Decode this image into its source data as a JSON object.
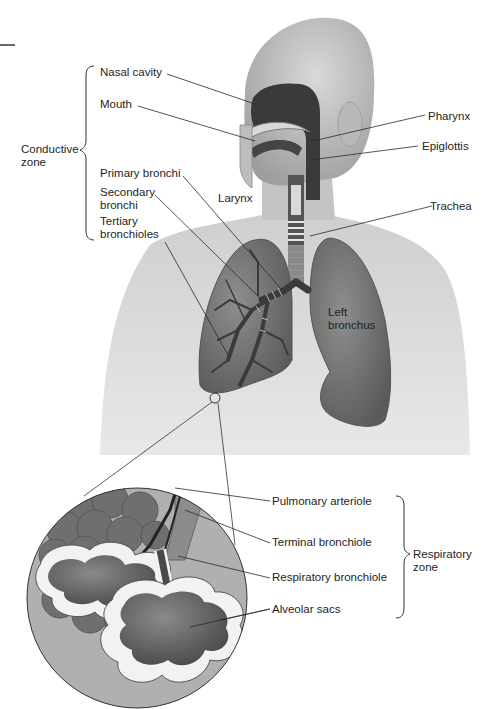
{
  "diagram": {
    "zones": {
      "conductive": {
        "label_line1": "Conductive",
        "label_line2": "zone"
      },
      "respiratory": {
        "label_line1": "Respiratory",
        "label_line2": "zone"
      }
    },
    "labels": {
      "nasal_cavity": "Nasal cavity",
      "mouth": "Mouth",
      "pharynx": "Pharynx",
      "epiglottis": "Epiglottis",
      "primary_bronchi": "Primary bronchi",
      "secondary_bronchi_1": "Secondary",
      "secondary_bronchi_2": "bronchi",
      "larynx": "Larynx",
      "trachea": "Trachea",
      "tertiary_bronchioles_1": "Tertiary",
      "tertiary_bronchioles_2": "bronchioles",
      "left_bronchus_1": "Left",
      "left_bronchus_2": "bronchus",
      "pulmonary_arteriole": "Pulmonary arteriole",
      "terminal_bronchiole": "Terminal bronchiole",
      "respiratory_bronchiole": "Respiratory bronchiole",
      "alveolar_sacs": "Alveolar sacs"
    },
    "colors": {
      "body": "#c8c8c8",
      "body_shadow": "#a9a9a9",
      "lung": "#7d7d7d",
      "lung_dark": "#5f5f5f",
      "airway": "#3a3a3a",
      "inset_bg": "#b5b5b5",
      "leader_line": "#2a2a2a"
    }
  }
}
